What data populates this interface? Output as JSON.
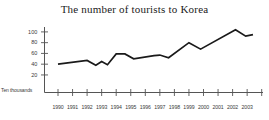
{
  "chart_data": {
    "type": "line",
    "title": "The number of tourists to Korea",
    "xlabel": "",
    "ylabel": "",
    "unit_label": "Ten thousands",
    "categories": [
      "1990",
      "1991",
      "1992",
      "1993",
      "1994",
      "1995",
      "1996",
      "1997",
      "1998",
      "1999",
      "2000",
      "2001",
      "2002",
      "2003"
    ],
    "values": [
      40,
      47,
      38,
      39,
      59,
      50,
      56,
      52,
      65,
      80,
      68,
      88,
      104,
      94
    ],
    "vertices": [
      {
        "x": 1990.0,
        "y": 40
      },
      {
        "x": 1992.0,
        "y": 47
      },
      {
        "x": 1992.6,
        "y": 38
      },
      {
        "x": 1993.0,
        "y": 45
      },
      {
        "x": 1993.4,
        "y": 39
      },
      {
        "x": 1994.0,
        "y": 59
      },
      {
        "x": 1994.6,
        "y": 59
      },
      {
        "x": 1995.2,
        "y": 50
      },
      {
        "x": 1996.6,
        "y": 56
      },
      {
        "x": 1997.0,
        "y": 57
      },
      {
        "x": 1997.6,
        "y": 52
      },
      {
        "x": 1999.0,
        "y": 80
      },
      {
        "x": 1999.8,
        "y": 68
      },
      {
        "x": 2002.2,
        "y": 104
      },
      {
        "x": 2002.9,
        "y": 92
      },
      {
        "x": 2003.4,
        "y": 95
      }
    ],
    "yticks": [
      20,
      40,
      60,
      80,
      100
    ],
    "ylim": [
      0,
      112
    ],
    "xlim": [
      1989.3,
      2003.9
    ],
    "grid": false,
    "legend": "none",
    "line_color": "#1a1a1a",
    "axis_color": "#555555"
  }
}
